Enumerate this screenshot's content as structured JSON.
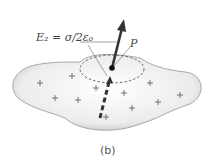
{
  "figure": {
    "caption": "(b)",
    "field_label": "E₂ = σ/2ε₀",
    "point_label": "P",
    "charges": "+",
    "colors": {
      "arrow": "#333333",
      "body_fill": "#e4e4e4",
      "body_edge": "#9a9a9a",
      "text": "#444444"
    }
  },
  "plus_positions": [
    [
      40,
      83
    ],
    [
      72,
      76
    ],
    [
      55,
      98
    ],
    [
      78,
      100
    ],
    [
      96,
      88
    ],
    [
      124,
      93
    ],
    [
      150,
      83
    ],
    [
      132,
      108
    ],
    [
      158,
      102
    ],
    [
      180,
      95
    ],
    [
      106,
      117
    ]
  ]
}
